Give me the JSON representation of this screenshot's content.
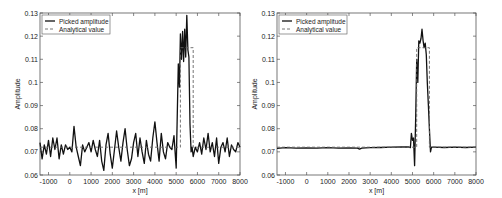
{
  "chart_data": [
    {
      "type": "line",
      "title": "",
      "xlabel": "x [m]",
      "ylabel": "Amplitude",
      "xlim": [
        -1400,
        8000
      ],
      "ylim": [
        0.06,
        0.13
      ],
      "xticks": [
        -1000,
        0,
        1000,
        2000,
        3000,
        4000,
        5000,
        6000,
        7000,
        8000
      ],
      "xtick_labels": [
        "-1000",
        "0",
        "1000",
        "2000",
        "3000",
        "4000",
        "5000",
        "6000",
        "7000",
        "8000"
      ],
      "yticks": [
        0.06,
        0.07,
        0.08,
        0.09,
        0.1,
        0.11,
        0.12,
        0.13
      ],
      "ytick_labels": [
        "0.06",
        "0.07",
        "0.08",
        "0.09",
        "0.1",
        "0.11",
        "0.12",
        "0.13"
      ],
      "grid": false,
      "legend_position": "upper left",
      "series": [
        {
          "name": "Picked amplitude",
          "style": "solid",
          "x": [
            -1400,
            -1300,
            -1200,
            -1100,
            -1000,
            -900,
            -800,
            -700,
            -600,
            -500,
            -400,
            -300,
            -200,
            -100,
            0,
            100,
            200,
            300,
            400,
            500,
            600,
            700,
            800,
            900,
            1000,
            1100,
            1200,
            1300,
            1400,
            1500,
            1600,
            1700,
            1800,
            1900,
            2000,
            2100,
            2200,
            2300,
            2400,
            2500,
            2600,
            2700,
            2800,
            2900,
            3000,
            3100,
            3200,
            3300,
            3400,
            3500,
            3600,
            3700,
            3800,
            3900,
            4000,
            4100,
            4200,
            4300,
            4400,
            4500,
            4600,
            4700,
            4800,
            4900,
            5000,
            5100,
            5150,
            5200,
            5250,
            5300,
            5350,
            5400,
            5450,
            5500,
            5550,
            5600,
            5650,
            5700,
            5750,
            5800,
            5900,
            6000,
            6100,
            6200,
            6300,
            6400,
            6500,
            6600,
            6700,
            6800,
            6900,
            7000,
            7100,
            7200,
            7300,
            7400,
            7500,
            7600,
            7700,
            7800,
            7900,
            8000
          ],
          "y": [
            0.074,
            0.067,
            0.073,
            0.069,
            0.075,
            0.068,
            0.076,
            0.071,
            0.076,
            0.067,
            0.073,
            0.069,
            0.073,
            0.071,
            0.072,
            0.07,
            0.081,
            0.072,
            0.068,
            0.064,
            0.073,
            0.07,
            0.072,
            0.074,
            0.07,
            0.075,
            0.071,
            0.068,
            0.075,
            0.066,
            0.062,
            0.073,
            0.078,
            0.069,
            0.063,
            0.071,
            0.079,
            0.072,
            0.066,
            0.074,
            0.08,
            0.071,
            0.064,
            0.067,
            0.074,
            0.078,
            0.068,
            0.076,
            0.07,
            0.065,
            0.075,
            0.069,
            0.066,
            0.076,
            0.083,
            0.074,
            0.066,
            0.078,
            0.07,
            0.067,
            0.074,
            0.072,
            0.071,
            0.077,
            0.063,
            0.108,
            0.098,
            0.121,
            0.11,
            0.122,
            0.109,
            0.123,
            0.111,
            0.129,
            0.114,
            0.111,
            0.082,
            0.07,
            0.072,
            0.068,
            0.072,
            0.07,
            0.074,
            0.069,
            0.076,
            0.071,
            0.078,
            0.07,
            0.074,
            0.068,
            0.076,
            0.065,
            0.072,
            0.074,
            0.07,
            0.076,
            0.068,
            0.073,
            0.071,
            0.07,
            0.074,
            0.072
          ]
        },
        {
          "name": "Analytical value",
          "style": "dashed",
          "x": [
            -1400,
            5200,
            5200,
            5800,
            5800,
            8000
          ],
          "y": [
            0.072,
            0.072,
            0.115,
            0.115,
            0.072,
            0.072
          ]
        }
      ]
    },
    {
      "type": "line",
      "title": "",
      "xlabel": "x [m]",
      "ylabel": "Amplitude",
      "xlim": [
        -1400,
        8000
      ],
      "ylim": [
        0.06,
        0.13
      ],
      "xticks": [
        -1000,
        0,
        1000,
        2000,
        3000,
        4000,
        5000,
        6000,
        7000,
        8000
      ],
      "xtick_labels": [
        "-1000",
        "0",
        "1000",
        "2000",
        "3000",
        "4000",
        "5000",
        "6000",
        "7000",
        "8000"
      ],
      "yticks": [
        0.06,
        0.07,
        0.08,
        0.09,
        0.1,
        0.11,
        0.12,
        0.13
      ],
      "ytick_labels": [
        "0.06",
        "0.07",
        "0.08",
        "0.09",
        "0.1",
        "0.11",
        "0.12",
        "0.13"
      ],
      "grid": false,
      "legend_position": "upper left",
      "series": [
        {
          "name": "Picked amplitude",
          "style": "solid",
          "x": [
            -1400,
            -1000,
            -500,
            0,
            500,
            1000,
            1500,
            2000,
            2400,
            2500,
            2600,
            3000,
            3500,
            4000,
            4500,
            4800,
            4900,
            4950,
            5000,
            5050,
            5100,
            5150,
            5200,
            5250,
            5300,
            5350,
            5400,
            5450,
            5500,
            5550,
            5600,
            5650,
            5700,
            5750,
            5800,
            5850,
            5900,
            6000,
            6500,
            7000,
            7500,
            8000
          ],
          "y": [
            0.0715,
            0.0718,
            0.0716,
            0.0717,
            0.0716,
            0.0718,
            0.0716,
            0.0717,
            0.0716,
            0.0712,
            0.0716,
            0.0718,
            0.0719,
            0.072,
            0.0721,
            0.0722,
            0.0718,
            0.078,
            0.075,
            0.076,
            0.064,
            0.085,
            0.11,
            0.1,
            0.118,
            0.117,
            0.119,
            0.123,
            0.118,
            0.115,
            0.117,
            0.112,
            0.1,
            0.09,
            0.08,
            0.07,
            0.072,
            0.072,
            0.0719,
            0.072,
            0.0719,
            0.072
          ]
        },
        {
          "name": "Analytical value",
          "style": "dashed",
          "x": [
            -1400,
            5200,
            5200,
            5800,
            5800,
            8000
          ],
          "y": [
            0.072,
            0.072,
            0.115,
            0.115,
            0.072,
            0.072
          ]
        }
      ]
    }
  ],
  "panels": [
    {
      "legend": [
        "Picked amplitude",
        "Analytical value"
      ],
      "xlabel": "x [m]",
      "ylabel": "Amplitude"
    },
    {
      "legend": [
        "Picked amplitude",
        "Analytical value"
      ],
      "xlabel": "x [m]",
      "ylabel": "Amplitude"
    }
  ]
}
